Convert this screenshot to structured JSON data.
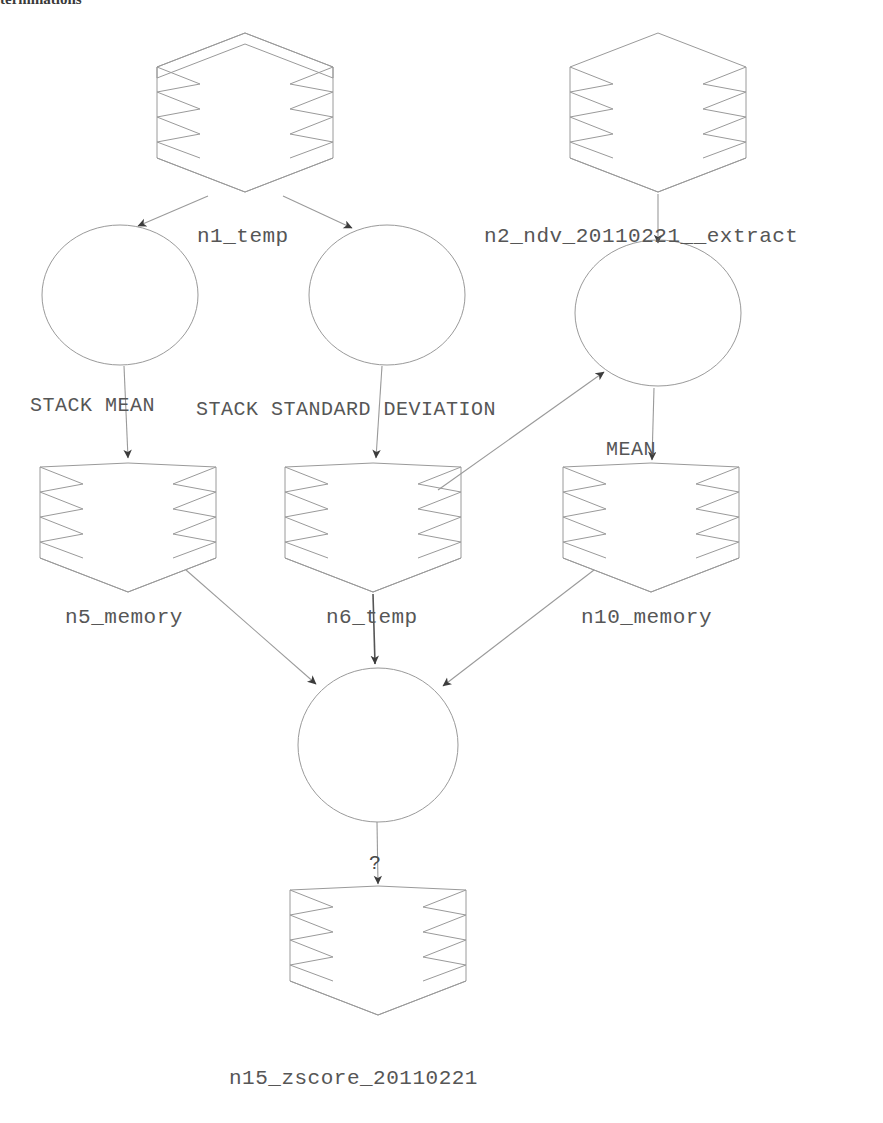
{
  "page": {
    "clipped_header_text": "terminations",
    "background": "#ffffff",
    "line_color": "#8c8c8c",
    "text_color": "#565656",
    "arrow_color": "#3c3c3c"
  },
  "diagram": {
    "type": "directed-graph",
    "title": "",
    "nodes": [
      {
        "id": "n1",
        "label": "n1_temp",
        "shape": "stack",
        "cx": 245,
        "cy": 100,
        "label_x": 197,
        "label_y": 226
      },
      {
        "id": "c1",
        "label": "",
        "shape": "circle",
        "cx": 120,
        "cy": 295,
        "label_x": 0,
        "label_y": 0
      },
      {
        "id": "c2",
        "label": "",
        "shape": "circle",
        "cx": 387,
        "cy": 295,
        "label_x": 0,
        "label_y": 0
      },
      {
        "id": "n2",
        "label": "n2_ndv_20110221__extract",
        "shape": "stack",
        "cx": 658,
        "cy": 100,
        "label_x": 484,
        "label_y": 226
      },
      {
        "id": "c3",
        "label": "",
        "shape": "circle",
        "cx": 658,
        "cy": 315,
        "label_x": 0,
        "label_y": 0
      },
      {
        "id": "n5",
        "label": "n5_memory",
        "shape": "stack",
        "cx": 128,
        "cy": 530,
        "label_x": 65,
        "label_y": 607
      },
      {
        "id": "n6",
        "label": "n6_temp",
        "shape": "stack",
        "cx": 373,
        "cy": 530,
        "label_x": 326,
        "label_y": 607
      },
      {
        "id": "n10",
        "label": "n10_memory",
        "shape": "stack",
        "cx": 651,
        "cy": 530,
        "label_x": 581,
        "label_y": 607
      },
      {
        "id": "c4",
        "label": "",
        "shape": "circle",
        "cx": 378,
        "cy": 745,
        "label_x": 0,
        "label_y": 0
      },
      {
        "id": "n15",
        "label": "n15_zscore_20110221",
        "shape": "stack",
        "cx": 378,
        "cy": 955,
        "label_x": 229,
        "label_y": 1068
      }
    ],
    "edges": [
      {
        "from": "n1",
        "to": "c1",
        "label": "",
        "label_x": 0,
        "label_y": 0
      },
      {
        "from": "n1",
        "to": "c2",
        "label": "",
        "label_x": 0,
        "label_y": 0
      },
      {
        "from": "n2",
        "to": "c3",
        "label": "",
        "label_x": 0,
        "label_y": 0
      },
      {
        "from": "c1",
        "to": "n5",
        "label": "STACK MEAN",
        "label_x": 30,
        "label_y": 396
      },
      {
        "from": "c2",
        "to": "n6",
        "label": "STACK STANDARD DEVIATION",
        "label_x": 196,
        "label_y": 400
      },
      {
        "from": "n6",
        "to": "c3",
        "label": "",
        "label_x": 0,
        "label_y": 0
      },
      {
        "from": "c3",
        "to": "n10",
        "label": "MEAN",
        "label_x": 606,
        "label_y": 440
      },
      {
        "from": "n5",
        "to": "c4",
        "label": "",
        "label_x": 0,
        "label_y": 0
      },
      {
        "from": "n6",
        "to": "c4",
        "label": "",
        "label_x": 0,
        "label_y": 0
      },
      {
        "from": "n10",
        "to": "c4",
        "label": "",
        "label_x": 0,
        "label_y": 0
      },
      {
        "from": "c4",
        "to": "n15",
        "label": "?",
        "label_x": 369,
        "label_y": 862
      }
    ]
  }
}
